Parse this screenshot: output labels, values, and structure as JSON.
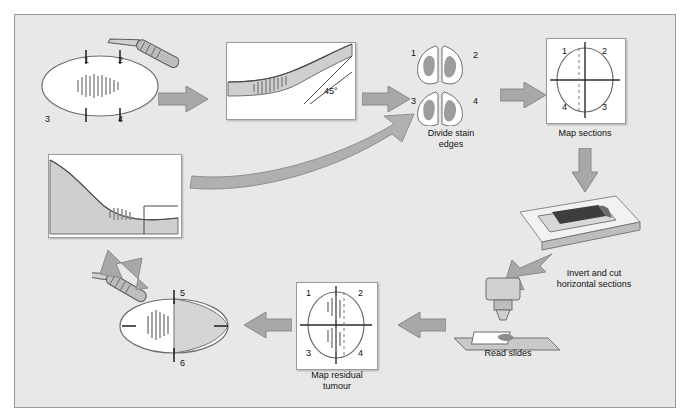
{
  "figure": {
    "background": "#e8e8e8",
    "accent": "#9aa0a6",
    "tissue_color": "#8d8d8d",
    "title": ""
  },
  "steps": [
    {
      "id": "specimen-marking",
      "caption": "",
      "quadrant_labels": [
        "1",
        "2",
        "3",
        "4"
      ]
    },
    {
      "id": "angled-excision",
      "caption": "",
      "angle_label": "45°"
    },
    {
      "id": "divide-stain-edges",
      "caption_line1": "Divide stain",
      "caption_line2": "edges",
      "quadrant_labels": [
        "1",
        "2",
        "3",
        "4"
      ]
    },
    {
      "id": "map-sections",
      "caption": "Map sections",
      "quadrant_labels": [
        "1",
        "2",
        "4",
        "3"
      ]
    },
    {
      "id": "invert-and-cut",
      "caption_line1": "Invert and cut",
      "caption_line2": "horizontal sections"
    },
    {
      "id": "read-slides",
      "caption": "Read slides"
    },
    {
      "id": "map-residual-tumour",
      "caption_line1": "Map residual",
      "caption_line2": "tumour",
      "quadrant_labels": [
        "1",
        "2",
        "3",
        "4"
      ]
    },
    {
      "id": "re-excision",
      "caption": "",
      "marks": [
        "5",
        "6"
      ]
    },
    {
      "id": "wound-bed",
      "caption": ""
    }
  ]
}
